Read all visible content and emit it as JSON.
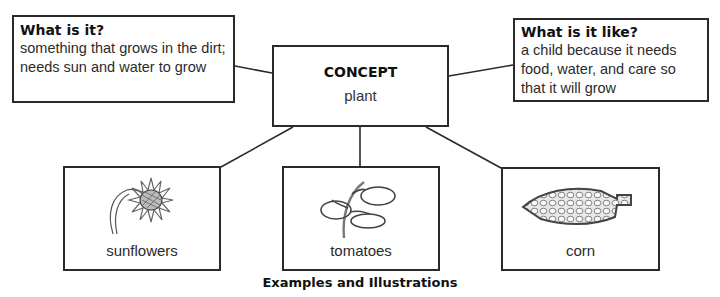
{
  "diagram": {
    "concept": {
      "title": "CONCEPT",
      "word": "plant"
    },
    "what_is_it": {
      "title": "What is it?",
      "text": "something that grows in the dirt; needs sun and water to grow"
    },
    "what_is_it_like": {
      "title": "What is it like?",
      "text": "a child because it needs food, water, and care so that it will grow"
    },
    "examples": [
      {
        "label": "sunflowers",
        "illustration": "sunflower-drawing"
      },
      {
        "label": "tomatoes",
        "illustration": "tomato-plant-drawing"
      },
      {
        "label": "corn",
        "illustration": "corn-cob-drawing"
      }
    ],
    "caption": "Examples and Illustrations",
    "colors": {
      "border": "#2a2a2a",
      "text": "#222222",
      "background": "#ffffff"
    }
  }
}
